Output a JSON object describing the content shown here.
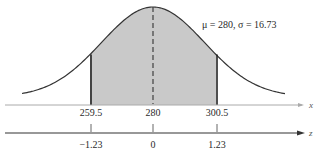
{
  "chart_data": {
    "type": "area",
    "title": "",
    "annotation": "μ = 280, σ = 16.73",
    "mean": 280,
    "std_dev": 16.73,
    "shaded_region": {
      "x_from": 259.5,
      "x_to": 300.5,
      "z_from": -1.23,
      "z_to": 1.23
    },
    "mean_line": {
      "x": 280,
      "style": "dashed"
    },
    "x_axis": {
      "label": "x",
      "tick_labels": [
        "259.5",
        "280",
        "300.5"
      ],
      "ticks": [
        259.5,
        280,
        300.5
      ]
    },
    "z_axis": {
      "label": "z",
      "tick_labels": [
        "−1.23",
        "0",
        "1.23"
      ],
      "ticks": [
        -1.23,
        0,
        1.23
      ]
    },
    "colors": {
      "shade": "#c9c9c9",
      "curve": "#333333",
      "axis": "#999999",
      "z_axis": "#333333"
    }
  }
}
